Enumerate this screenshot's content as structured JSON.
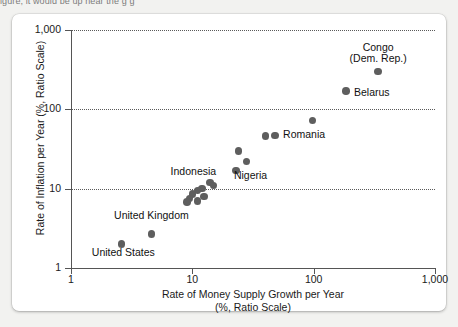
{
  "top_caption": "igure, it would be up near the g          g",
  "chart_data": {
    "type": "scatter",
    "title": "",
    "xlabel": "Rate of Money Supply Growth per Year",
    "xlabel_line2": "(%, Ratio Scale)",
    "ylabel": "Rate of Inflation per Year (%, Ratio Scale)",
    "xscale": "log",
    "yscale": "log",
    "xlim": [
      1,
      1000
    ],
    "ylim": [
      1,
      1000
    ],
    "grid": true,
    "grid_axis": "y",
    "legend": "none",
    "x_ticks": [
      "1",
      "10",
      "100",
      "1,000"
    ],
    "x_tick_values": [
      1,
      10,
      100,
      1000
    ],
    "y_ticks": [
      "1",
      "10",
      "100",
      "1,000"
    ],
    "y_tick_values": [
      1,
      10,
      100,
      1000
    ],
    "marker_color": "#5e5e5e",
    "points": [
      {
        "label": "Congo (Dem. Rep.)",
        "x": 340,
        "y": 300
      },
      {
        "label": "Belarus",
        "x": 185,
        "y": 170
      },
      {
        "label": "",
        "x": 98,
        "y": 72
      },
      {
        "label": "Romania",
        "x": 40,
        "y": 46
      },
      {
        "label": "",
        "x": 48,
        "y": 47
      },
      {
        "label": "",
        "x": 24,
        "y": 30
      },
      {
        "label": "Nigeria",
        "x": 28,
        "y": 22
      },
      {
        "label": "",
        "x": 23,
        "y": 17
      },
      {
        "label": "",
        "x": 14,
        "y": 12
      },
      {
        "label": "",
        "x": 15,
        "y": 11
      },
      {
        "label": "Indonesia",
        "x": 12,
        "y": 10
      },
      {
        "label": "",
        "x": 11,
        "y": 9.5
      },
      {
        "label": "",
        "x": 10,
        "y": 8.5
      },
      {
        "label": "",
        "x": 12.5,
        "y": 8
      },
      {
        "label": "",
        "x": 9.5,
        "y": 7.5
      },
      {
        "label": "",
        "x": 11,
        "y": 7
      },
      {
        "label": "",
        "x": 9,
        "y": 6.8
      },
      {
        "label": "United Kingdom",
        "x": 4.6,
        "y": 2.7
      },
      {
        "label": "United States",
        "x": 2.6,
        "y": 2.0
      }
    ],
    "annotations": [
      {
        "text": "Congo",
        "text_line2": "(Dem. Rep.)",
        "x": 340,
        "y": 560,
        "anchor": "center"
      },
      {
        "text": "Belarus",
        "x": 215,
        "y": 150,
        "anchor": "left"
      },
      {
        "text": "Romania",
        "x": 56,
        "y": 45,
        "anchor": "left"
      },
      {
        "text": "Nigeria",
        "x": 22,
        "y": 13.5,
        "anchor": "left"
      },
      {
        "text": "Indonesia",
        "x": 10.2,
        "y": 15.5,
        "anchor": "center"
      },
      {
        "text": "United Kingdom",
        "x": 4.6,
        "y": 4.3,
        "anchor": "center"
      },
      {
        "text": "United States",
        "x": 2.7,
        "y": 1.45,
        "anchor": "center"
      }
    ]
  }
}
